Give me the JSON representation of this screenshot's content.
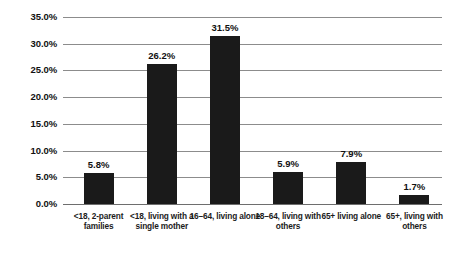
{
  "chart_data": {
    "type": "bar",
    "title": "",
    "subtitle": "",
    "xlabel": "",
    "ylabel": "",
    "categories": [
      "<18, 2-parent families",
      "<18, living with a single mother",
      "16–64, living alone",
      "18–64, living with others",
      "65+ living alone",
      "65+, living with others"
    ],
    "values": [
      5.8,
      26.2,
      31.5,
      5.9,
      7.9,
      1.7
    ],
    "value_labels": [
      "5.8%",
      "26.2%",
      "31.5%",
      "5.9%",
      "7.9%",
      "1.7%"
    ],
    "ylim": [
      0,
      35
    ],
    "ytick_labels": [
      "0.0%",
      "5.0%",
      "10.0%",
      "15.0%",
      "20.0%",
      "25.0%",
      "30.0%",
      "35.0%"
    ],
    "ytick_values": [
      0,
      5,
      10,
      15,
      20,
      25,
      30,
      35
    ],
    "grid": true,
    "legend": null,
    "legend_position": "none",
    "bar_color": "#1a1a1a",
    "gridline_color": "#8c8c8c",
    "background_color": "#ffffff"
  }
}
